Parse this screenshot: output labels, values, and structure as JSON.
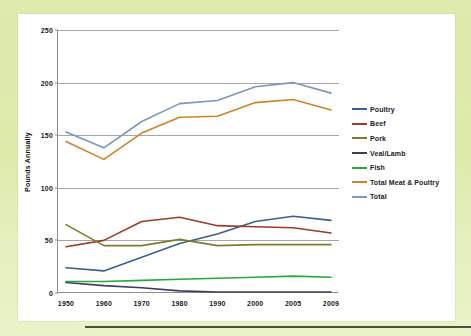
{
  "slide": {
    "background_color": "#dcebaa",
    "card_color": "#ffffff",
    "rule_color": "#2e3320"
  },
  "chart_data": {
    "type": "line",
    "title": "",
    "xlabel": "",
    "ylabel": "Pounds Annually",
    "categories": [
      "1950",
      "1960",
      "1970",
      "1980",
      "1990",
      "2000",
      "2005",
      "2009"
    ],
    "x_tick_labels": [
      "1950",
      "1960",
      "1970",
      "1980",
      "1990",
      "2000",
      "2005",
      "2009"
    ],
    "y_tick_labels": [
      "0",
      "50",
      "100",
      "150",
      "200",
      "250"
    ],
    "y_ticks": [
      0,
      50,
      100,
      150,
      200,
      250
    ],
    "ylim": [
      0,
      250
    ],
    "grid": "horizontal",
    "legend_position": "right",
    "series": [
      {
        "name": "Poultry",
        "color": "#3a5f91",
        "values": [
          24,
          21,
          34,
          47,
          56,
          68,
          73,
          69
        ]
      },
      {
        "name": "Beef",
        "color": "#9e3a26",
        "values": [
          44,
          50,
          68,
          72,
          64,
          63,
          62,
          57
        ]
      },
      {
        "name": "Pork",
        "color": "#7d7d29",
        "values": [
          65,
          45,
          45,
          51,
          45,
          46,
          46,
          46
        ]
      },
      {
        "name": "Veal/Lamb",
        "color": "#413c5e",
        "values": [
          10,
          7,
          5,
          2,
          1,
          1,
          1,
          1
        ]
      },
      {
        "name": "Fish",
        "color": "#2aa83c",
        "values": [
          11,
          11,
          12,
          13,
          14,
          15,
          16,
          15
        ]
      },
      {
        "name": "Total Meat & Poultry",
        "color": "#d08326",
        "values": [
          144,
          127,
          152,
          167,
          168,
          181,
          184,
          174
        ]
      },
      {
        "name": "Total",
        "color": "#7e96bb",
        "values": [
          153,
          138,
          163,
          180,
          183,
          196,
          200,
          190
        ]
      }
    ]
  }
}
